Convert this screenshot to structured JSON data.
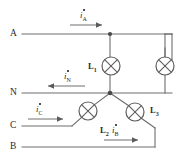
{
  "figure": {
    "kind": "circuit-diagram",
    "background_color": "#ffffff",
    "wire_color": "#6e6e6e",
    "text_color": "#2b2b2b"
  },
  "terminals": [
    {
      "id": "A",
      "label": "A",
      "x": 10,
      "y": 29
    },
    {
      "id": "N",
      "label": "N",
      "x": 10,
      "y": 88
    },
    {
      "id": "C",
      "label": "C",
      "x": 10,
      "y": 123
    },
    {
      "id": "B",
      "label": "B",
      "x": 10,
      "y": 142
    }
  ],
  "lamps": [
    {
      "id": "L1",
      "label": "L",
      "subscript": "1",
      "cx": 111,
      "cy": 66,
      "r": 9,
      "label_x": 88,
      "label_y": 62
    },
    {
      "id": "Lright",
      "label": "",
      "subscript": "",
      "cx": 165,
      "cy": 66,
      "r": 9,
      "label_x": 0,
      "label_y": 0
    },
    {
      "id": "L2",
      "label": "L",
      "subscript": "2",
      "cx": 88,
      "cy": 111,
      "r": 9,
      "label_x": 100,
      "label_y": 128
    },
    {
      "id": "L3",
      "label": "L",
      "subscript": "3",
      "cx": 135,
      "cy": 112,
      "r": 9,
      "label_x": 152,
      "label_y": 112
    }
  ],
  "currents": [
    {
      "id": "iA",
      "symbol": "i",
      "subscript": "A",
      "label_x": 78,
      "label_y": 13,
      "direction": "right"
    },
    {
      "id": "iN",
      "symbol": "i",
      "subscript": "N",
      "label_x": 63,
      "label_y": 73,
      "direction": "left"
    },
    {
      "id": "iC",
      "symbol": "i",
      "subscript": "C",
      "label_x": 33,
      "label_y": 108,
      "direction": "right"
    },
    {
      "id": "iB",
      "symbol": "i",
      "subscript": "B",
      "label_x": 110,
      "label_y": 130,
      "direction": "right"
    }
  ],
  "nodes": [
    {
      "id": "node-A-tap",
      "x": 110,
      "y": 34
    },
    {
      "id": "node-star",
      "x": 110,
      "y": 93
    }
  ]
}
